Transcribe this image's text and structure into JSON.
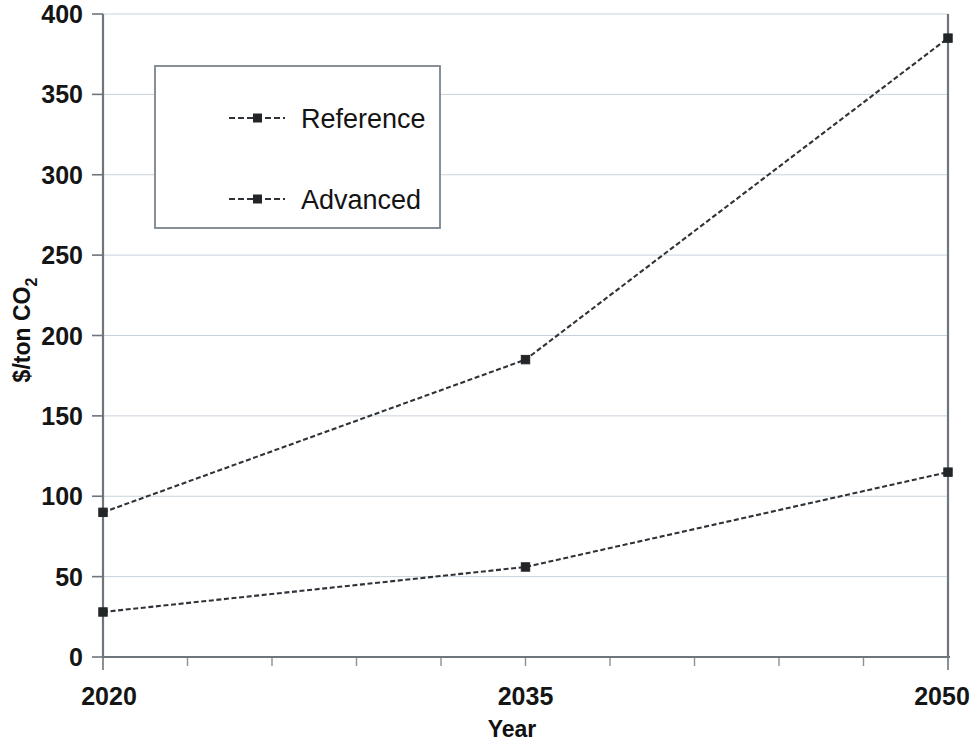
{
  "chart_data": {
    "type": "line",
    "title": "",
    "xlabel": "Year",
    "ylabel": "$/ton CO2",
    "ylabel_display": "$/ton CO",
    "ylabel_subscript": "2",
    "x": [
      2020,
      2035,
      2050
    ],
    "categories": [
      "2020",
      "2035",
      "2050"
    ],
    "series": [
      {
        "name": "Reference",
        "values": [
          90,
          185,
          385
        ]
      },
      {
        "name": "Advanced",
        "values": [
          28,
          56,
          115
        ]
      }
    ],
    "xlim": [
      2020,
      2050
    ],
    "ylim": [
      0,
      400
    ],
    "ytick_values": [
      0,
      50,
      100,
      150,
      200,
      250,
      300,
      350,
      400
    ],
    "ytick_labels": [
      "0",
      "50",
      "100",
      "150",
      "200",
      "250",
      "300",
      "350",
      "400"
    ],
    "xtick_labels": [
      "2020",
      "2035",
      "2050"
    ],
    "x_minor_tick_count": 10,
    "grid": true,
    "grid_axis": "y",
    "legend_position": "upper-left-inside",
    "line_style": "dashed",
    "marker": "square",
    "colors": {
      "reference_line": "#2f3338",
      "advanced_line": "#2f3338",
      "grid": "#c9d2da",
      "axis": "#6e757c",
      "text": "#151515",
      "background": "#ffffff"
    }
  },
  "legend": {
    "entries": [
      {
        "label": "Reference"
      },
      {
        "label": "Advanced"
      }
    ]
  },
  "axes": {
    "y_title_main": "$/ton CO",
    "y_title_sub": "2",
    "x_title": "Year"
  }
}
